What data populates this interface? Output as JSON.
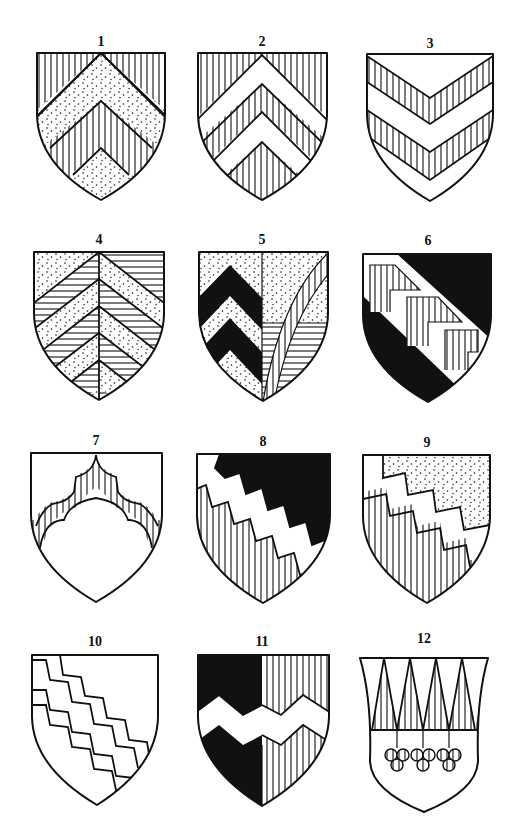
{
  "figure": {
    "title": "",
    "colors": {
      "ink": "#111111",
      "paper": "#ffffff"
    },
    "tinctures_legend": {
      "vertical_lines": "gules (red)",
      "horizontal_lines": "azure (blue)",
      "dots": "or (gold)",
      "solid_black": "sable (black)",
      "plain": "argent (silver)"
    }
  },
  "shields": [
    {
      "number": "1",
      "design": "Chevron dotted on vertical-hatched field, with a second chevron point at base",
      "tinctures": [
        "vertical_lines",
        "dots"
      ]
    },
    {
      "number": "2",
      "design": "Two plain chevrons on vertical-hatched field (chevronny)",
      "tinctures": [
        "vertical_lines",
        "plain"
      ]
    },
    {
      "number": "3",
      "design": "Two vertical-hatched chevrons on plain field",
      "tinctures": [
        "plain",
        "vertical_lines"
      ]
    },
    {
      "number": "4",
      "design": "Per pale, chevronny dotted and horizontal-hatched, counterchanged",
      "tinctures": [
        "dots",
        "horizontal_lines"
      ]
    },
    {
      "number": "5",
      "design": "Per pale: dexter dotted with two black chevrons; sinister dotted over horizontal-hatched with a curved vertical-hatched flaunch",
      "tinctures": [
        "dots",
        "solid_black",
        "horizontal_lines",
        "vertical_lines"
      ]
    },
    {
      "number": "6",
      "design": "Black field with plain bend charged with vertical-hatched chevronels",
      "tinctures": [
        "solid_black",
        "plain",
        "vertical_lines"
      ]
    },
    {
      "number": "7",
      "design": "Plain field with a vertical-hatched cusped (embattled-arch) chevron",
      "tinctures": [
        "plain",
        "vertical_lines"
      ]
    },
    {
      "number": "8",
      "design": "Per bend dancetty (indented): black chief, plain bend, vertical-hatched base",
      "tinctures": [
        "solid_black",
        "plain",
        "vertical_lines"
      ]
    },
    {
      "number": "9",
      "design": "Per bend indented: dotted chief, plain bend, vertical-hatched base",
      "tinctures": [
        "dots",
        "plain",
        "vertical_lines"
      ]
    },
    {
      "number": "10",
      "design": "Plain field with two bends indented (stepped lines)",
      "tinctures": [
        "plain"
      ]
    },
    {
      "number": "11",
      "design": "Per pale black and vertical-hatched, a fess dancetty plain",
      "tinctures": [
        "solid_black",
        "vertical_lines",
        "plain"
      ]
    },
    {
      "number": "12",
      "design": "Chief indented of four vertical-hatched piles, three trefoils slipped pendant from the chief",
      "tinctures": [
        "vertical_lines",
        "plain"
      ]
    }
  ]
}
